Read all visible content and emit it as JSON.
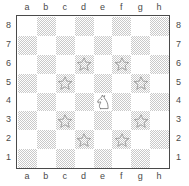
{
  "figure": {
    "type": "chess-board-diagram",
    "board_size": 8
  },
  "labels": {
    "files": [
      "a",
      "b",
      "c",
      "d",
      "e",
      "f",
      "g",
      "h"
    ],
    "ranks": [
      "8",
      "7",
      "6",
      "5",
      "4",
      "3",
      "2",
      "1"
    ],
    "files_top": [
      "a",
      "b",
      "c",
      "d",
      "e",
      "f",
      "g",
      "h"
    ],
    "files_bottom": [
      "a",
      "b",
      "c",
      "d",
      "e",
      "f",
      "g",
      "h"
    ],
    "ranks_left": [
      "8",
      "7",
      "6",
      "5",
      "4",
      "3",
      "2",
      "1"
    ],
    "ranks_right": [
      "8",
      "7",
      "6",
      "5",
      "4",
      "3",
      "2",
      "1"
    ]
  },
  "colors": {
    "light_square": "#ffffff",
    "dark_square": "#c9c9c9",
    "border": "#4a4a4a",
    "label_text": "#4a4a4a",
    "marker_stroke": "#8e8e8e",
    "piece_stroke": "#6e6e6e",
    "piece_fill": "#ffffff",
    "page_background": "#ffffff"
  },
  "pieces": [
    {
      "square": "e4",
      "file": "e",
      "rank": "4",
      "piece": "knight",
      "color": "white",
      "symbol": "N",
      "icon": "knight-icon"
    }
  ],
  "markers": [
    {
      "square": "d6",
      "file": "d",
      "rank": "6",
      "marker": "star",
      "icon": "star-icon"
    },
    {
      "square": "f6",
      "file": "f",
      "rank": "6",
      "marker": "star",
      "icon": "star-icon"
    },
    {
      "square": "c5",
      "file": "c",
      "rank": "5",
      "marker": "star",
      "icon": "star-icon"
    },
    {
      "square": "g5",
      "file": "g",
      "rank": "5",
      "marker": "star",
      "icon": "star-icon"
    },
    {
      "square": "c3",
      "file": "c",
      "rank": "3",
      "marker": "star",
      "icon": "star-icon"
    },
    {
      "square": "g3",
      "file": "g",
      "rank": "3",
      "marker": "star",
      "icon": "star-icon"
    },
    {
      "square": "d2",
      "file": "d",
      "rank": "2",
      "marker": "star",
      "icon": "star-icon"
    },
    {
      "square": "f2",
      "file": "f",
      "rank": "2",
      "marker": "star",
      "icon": "star-icon"
    }
  ],
  "chart_data": {
    "type": "heatmap",
    "title": "",
    "xlabel": "",
    "ylabel": "",
    "categories": [
      "a",
      "b",
      "c",
      "d",
      "e",
      "f",
      "g",
      "h"
    ],
    "rows": [
      "8",
      "7",
      "6",
      "5",
      "4",
      "3",
      "2",
      "1"
    ],
    "grid": true,
    "legend": "none",
    "cells": [
      {
        "square": "a8",
        "shade": "light",
        "content": ""
      },
      {
        "square": "b8",
        "shade": "dark",
        "content": ""
      },
      {
        "square": "c8",
        "shade": "light",
        "content": ""
      },
      {
        "square": "d8",
        "shade": "dark",
        "content": ""
      },
      {
        "square": "e8",
        "shade": "light",
        "content": ""
      },
      {
        "square": "f8",
        "shade": "dark",
        "content": ""
      },
      {
        "square": "g8",
        "shade": "light",
        "content": ""
      },
      {
        "square": "h8",
        "shade": "dark",
        "content": ""
      },
      {
        "square": "a7",
        "shade": "dark",
        "content": ""
      },
      {
        "square": "b7",
        "shade": "light",
        "content": ""
      },
      {
        "square": "c7",
        "shade": "dark",
        "content": ""
      },
      {
        "square": "d7",
        "shade": "light",
        "content": ""
      },
      {
        "square": "e7",
        "shade": "dark",
        "content": ""
      },
      {
        "square": "f7",
        "shade": "light",
        "content": ""
      },
      {
        "square": "g7",
        "shade": "dark",
        "content": ""
      },
      {
        "square": "h7",
        "shade": "light",
        "content": ""
      },
      {
        "square": "a6",
        "shade": "light",
        "content": ""
      },
      {
        "square": "b6",
        "shade": "dark",
        "content": ""
      },
      {
        "square": "c6",
        "shade": "light",
        "content": ""
      },
      {
        "square": "d6",
        "shade": "dark",
        "content": "star"
      },
      {
        "square": "e6",
        "shade": "light",
        "content": ""
      },
      {
        "square": "f6",
        "shade": "dark",
        "content": "star"
      },
      {
        "square": "g6",
        "shade": "light",
        "content": ""
      },
      {
        "square": "h6",
        "shade": "dark",
        "content": ""
      },
      {
        "square": "a5",
        "shade": "dark",
        "content": ""
      },
      {
        "square": "b5",
        "shade": "light",
        "content": ""
      },
      {
        "square": "c5",
        "shade": "dark",
        "content": "star"
      },
      {
        "square": "d5",
        "shade": "light",
        "content": ""
      },
      {
        "square": "e5",
        "shade": "dark",
        "content": ""
      },
      {
        "square": "f5",
        "shade": "light",
        "content": ""
      },
      {
        "square": "g5",
        "shade": "dark",
        "content": "star"
      },
      {
        "square": "h5",
        "shade": "light",
        "content": ""
      },
      {
        "square": "a4",
        "shade": "light",
        "content": ""
      },
      {
        "square": "b4",
        "shade": "dark",
        "content": ""
      },
      {
        "square": "c4",
        "shade": "light",
        "content": ""
      },
      {
        "square": "d4",
        "shade": "dark",
        "content": ""
      },
      {
        "square": "e4",
        "shade": "light",
        "content": "knight"
      },
      {
        "square": "f4",
        "shade": "dark",
        "content": ""
      },
      {
        "square": "g4",
        "shade": "light",
        "content": ""
      },
      {
        "square": "h4",
        "shade": "dark",
        "content": ""
      },
      {
        "square": "a3",
        "shade": "dark",
        "content": ""
      },
      {
        "square": "b3",
        "shade": "light",
        "content": ""
      },
      {
        "square": "c3",
        "shade": "dark",
        "content": "star"
      },
      {
        "square": "d3",
        "shade": "light",
        "content": ""
      },
      {
        "square": "e3",
        "shade": "dark",
        "content": ""
      },
      {
        "square": "f3",
        "shade": "light",
        "content": ""
      },
      {
        "square": "g3",
        "shade": "dark",
        "content": "star"
      },
      {
        "square": "h3",
        "shade": "light",
        "content": ""
      },
      {
        "square": "a2",
        "shade": "light",
        "content": ""
      },
      {
        "square": "b2",
        "shade": "dark",
        "content": ""
      },
      {
        "square": "c2",
        "shade": "light",
        "content": ""
      },
      {
        "square": "d2",
        "shade": "dark",
        "content": "star"
      },
      {
        "square": "e2",
        "shade": "light",
        "content": ""
      },
      {
        "square": "f2",
        "shade": "dark",
        "content": "star"
      },
      {
        "square": "g2",
        "shade": "light",
        "content": ""
      },
      {
        "square": "h2",
        "shade": "dark",
        "content": ""
      },
      {
        "square": "a1",
        "shade": "dark",
        "content": ""
      },
      {
        "square": "b1",
        "shade": "light",
        "content": ""
      },
      {
        "square": "c1",
        "shade": "dark",
        "content": ""
      },
      {
        "square": "d1",
        "shade": "light",
        "content": ""
      },
      {
        "square": "e1",
        "shade": "dark",
        "content": ""
      },
      {
        "square": "f1",
        "shade": "light",
        "content": ""
      },
      {
        "square": "g1",
        "shade": "dark",
        "content": ""
      },
      {
        "square": "h1",
        "shade": "light",
        "content": ""
      }
    ]
  }
}
